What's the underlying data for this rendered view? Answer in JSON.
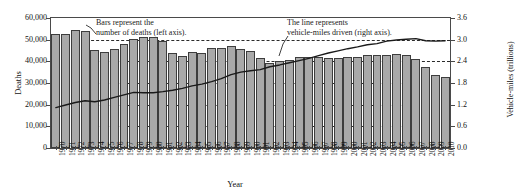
{
  "chart_data": {
    "type": "bar",
    "title": "",
    "xlabel": "Year",
    "ylabel": "Deaths",
    "y2label": "Vehicle-miles (trillions)",
    "grid": true,
    "legend": "annotations",
    "ylim": [
      0,
      60000
    ],
    "y2lim": [
      0.0,
      3.6
    ],
    "yticks": [
      "0",
      "10,000",
      "20,000",
      "30,000",
      "40,000",
      "50,000",
      "60,000"
    ],
    "ytick_values": [
      0,
      10000,
      20000,
      30000,
      40000,
      50000,
      60000
    ],
    "y2ticks": [
      "0.0",
      "0.6",
      "1.2",
      "1.8",
      "2.4",
      "3.0",
      "3.6"
    ],
    "y2tick_values": [
      0.0,
      0.6,
      1.2,
      1.8,
      2.4,
      3.0,
      3.6
    ],
    "categories": [
      "1970",
      "1971",
      "1972",
      "1973",
      "1974",
      "1975",
      "1976",
      "1977",
      "1978",
      "1979",
      "1980",
      "1981",
      "1982",
      "1983",
      "1984",
      "1985",
      "1986",
      "1987",
      "1988",
      "1989",
      "1990",
      "1991",
      "1992",
      "1993",
      "1994",
      "1995",
      "1996",
      "1997",
      "1998",
      "1999",
      "2000",
      "2001",
      "2002",
      "2003",
      "2004",
      "2005",
      "2006",
      "2007",
      "2008",
      "2009",
      "2010"
    ],
    "series": [
      {
        "name": "Bars represent the number of deaths (left axis).",
        "type": "bar",
        "axis": "left",
        "color": "#a9a9a9",
        "values": [
          52627,
          52542,
          54589,
          54052,
          45196,
          44525,
          45523,
          47878,
          50331,
          51093,
          51091,
          49301,
          43945,
          42589,
          44257,
          43825,
          46087,
          46390,
          47087,
          45582,
          44599,
          41508,
          39250,
          40150,
          40716,
          41817,
          42065,
          42013,
          41501,
          41717,
          41945,
          42196,
          43005,
          42884,
          42836,
          43510,
          42708,
          41259,
          37423,
          33883,
          32999
        ]
      },
      {
        "name": "The line represents vehicle-miles driven (right axis).",
        "type": "line",
        "axis": "right",
        "color": "#1a1a1a",
        "values": [
          1.12,
          1.19,
          1.26,
          1.31,
          1.28,
          1.33,
          1.4,
          1.47,
          1.54,
          1.53,
          1.53,
          1.56,
          1.6,
          1.65,
          1.72,
          1.77,
          1.84,
          1.92,
          2.03,
          2.1,
          2.14,
          2.17,
          2.25,
          2.3,
          2.36,
          2.42,
          2.48,
          2.56,
          2.63,
          2.69,
          2.75,
          2.8,
          2.86,
          2.89,
          2.96,
          2.99,
          3.01,
          3.03,
          2.97,
          2.96,
          2.97
        ]
      }
    ],
    "annotations": [
      {
        "id": "bars-annotation",
        "text": "Bars represent the\nnumber of deaths (left axis)."
      },
      {
        "id": "line-annotation",
        "text": "The line represents\nvehicle-miles driven (right axis)."
      }
    ],
    "colors": {
      "bar_fill": "#a9a9a9",
      "bar_stroke": "#3d3d3d",
      "line": "#1a1a1a",
      "grid": "#2b2b2b",
      "frame": "#4a4a4a",
      "background": "#ffffff"
    }
  }
}
